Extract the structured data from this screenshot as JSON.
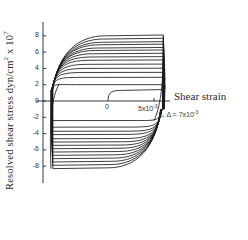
{
  "chart_data": {
    "type": "line",
    "title": "",
    "xlabel": "Shear strain",
    "ylabel": "Resolved shear stress dyn/cm^2 x 10^7",
    "ylabel_main": "Resolved shear stress dyn/cm",
    "ylabel_exp": "2",
    "ylabel_mult": " x 10",
    "ylabel_mult_exp": "7",
    "y_ticks": [
      "8",
      "6",
      "4",
      "2",
      "0",
      "-2",
      "-4",
      "-6",
      "-8"
    ],
    "y_tick_values": [
      8,
      6,
      4,
      2,
      0,
      -2,
      -4,
      -6,
      -8
    ],
    "x_ticks": [
      {
        "label": "0",
        "value": 0
      },
      {
        "label": "5x10",
        "exp": "-3",
        "value": 0.005
      }
    ],
    "annotation": {
      "text": "k, Δ = 7x10",
      "exp": "-3"
    },
    "ylim": [
      -9,
      9
    ],
    "xlim": [
      -0.007,
      0.007
    ],
    "grid": false,
    "legend": null,
    "initial_curve": {
      "x": [
        0,
        0.0002,
        0.0005,
        0.001,
        0.002,
        0.004,
        0.006
      ],
      "y": [
        0,
        0.8,
        1.1,
        1.25,
        1.3,
        1.35,
        1.4
      ]
    },
    "loop_upper_plateaus": [
      2.0,
      2.9,
      3.5,
      4.0,
      4.5,
      5.0,
      5.4,
      5.8,
      6.2,
      6.5,
      6.9,
      7.2,
      7.6,
      8.0
    ],
    "loop_lower_plateaus": [
      -2.4,
      -3.2,
      -3.7,
      -4.1,
      -4.6,
      -5.0,
      -5.4,
      -5.8,
      -6.2,
      -6.6,
      -7.0,
      -7.4,
      -7.8,
      -8.2
    ],
    "strain_left": -0.0065,
    "strain_right": 0.006
  }
}
